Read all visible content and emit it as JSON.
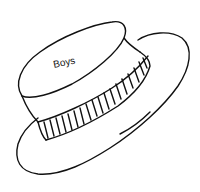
{
  "illustration": {
    "subject": "hat line drawing",
    "hat_label": "Boys",
    "colors": {
      "ink": "#111111",
      "paper": "#ffffff"
    }
  }
}
